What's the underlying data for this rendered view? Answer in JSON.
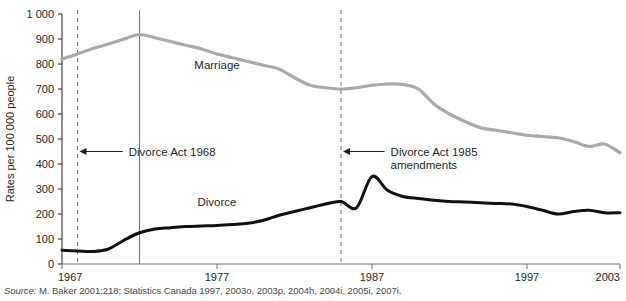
{
  "chart_data": {
    "type": "line",
    "title": "",
    "xlabel": "",
    "ylabel": "Rates per 100 000 people",
    "xlim": [
      1967,
      2003
    ],
    "ylim": [
      0,
      1000
    ],
    "grid": false,
    "legend": "inline-labels",
    "x_ticks": [
      "1967",
      "1977",
      "1987",
      "1997",
      "2003"
    ],
    "x_tick_values": [
      1967,
      1977,
      1987,
      1997,
      2003
    ],
    "y_ticks": [
      "0",
      "100",
      "200",
      "300",
      "400",
      "500",
      "600",
      "700",
      "800",
      "900",
      "1 000"
    ],
    "y_tick_values": [
      0,
      100,
      200,
      300,
      400,
      500,
      600,
      700,
      800,
      900,
      1000
    ],
    "x": [
      1967,
      1968,
      1969,
      1970,
      1971,
      1972,
      1973,
      1974,
      1975,
      1976,
      1977,
      1978,
      1979,
      1980,
      1981,
      1982,
      1983,
      1984,
      1985,
      1986,
      1987,
      1988,
      1989,
      1990,
      1991,
      1992,
      1993,
      1994,
      1995,
      1996,
      1997,
      1998,
      1999,
      2000,
      2001,
      2002,
      2003
    ],
    "series": [
      {
        "name": "Marriage",
        "color": "#a7a9ac",
        "label_x": 1977,
        "label_y": 780,
        "values": [
          820,
          840,
          862,
          880,
          900,
          918,
          905,
          890,
          875,
          860,
          840,
          825,
          810,
          795,
          780,
          745,
          715,
          705,
          700,
          705,
          715,
          720,
          718,
          700,
          640,
          600,
          570,
          545,
          535,
          525,
          515,
          510,
          505,
          490,
          470,
          480,
          445
        ]
      },
      {
        "name": "Divorce",
        "color": "#111111",
        "label_x": 1977,
        "label_y": 232,
        "values": [
          55,
          52,
          50,
          60,
          95,
          125,
          140,
          145,
          150,
          152,
          154,
          158,
          163,
          175,
          195,
          210,
          225,
          240,
          250,
          225,
          350,
          295,
          270,
          262,
          255,
          250,
          248,
          245,
          242,
          240,
          230,
          215,
          200,
          210,
          215,
          205,
          205
        ]
      }
    ],
    "annotations": [
      {
        "id": "divorce-act-1968",
        "text": "Divorce Act 1968",
        "marker_x": 1968,
        "marker_style": "dashed-vertical",
        "arrow_y": 450,
        "text_x": 1971.3,
        "text_y": 450
      },
      {
        "id": "divorce-act-1985-amendments",
        "text_line_1": "Divorce Act 1985",
        "text_line_2": "amendments",
        "marker_x": 1985,
        "marker_style": "dashed-vertical",
        "arrow_y": 450,
        "text_x": 1988.2,
        "text_y": 455
      }
    ],
    "reference_lines": [
      {
        "id": "solid-reference-1972",
        "x": 1972,
        "style": "solid",
        "color": "#6d6e71"
      }
    ]
  },
  "source": {
    "prefix": "Source:",
    "text": " M. Baker 2001:218; Statistics Canada 1997, 2003o, 2003p, 2004h, 2004i, 2005i, 2007i."
  }
}
